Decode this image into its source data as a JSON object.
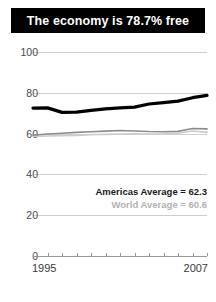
{
  "title": "The economy is 78.7% free",
  "legend": {
    "americas": "Americas Average = 62.3",
    "world": "World Average = 60.6"
  },
  "axis": {
    "x_start_label": "1995",
    "x_end_label": "2007"
  },
  "colors": {
    "title_background": "#000000",
    "title_text": "#ffffff",
    "country_line": "#000000",
    "americas_line": "#8c8c8c",
    "world_line": "#cccccc",
    "gridline": "#cfcfcf",
    "axis": "#9a9a9a"
  },
  "chart_data": {
    "type": "line",
    "title": "The economy is 78.7% free",
    "xlabel": "",
    "ylabel": "",
    "xlim": [
      1995,
      2007
    ],
    "ylim": [
      0,
      100
    ],
    "yticks": [
      0,
      20,
      40,
      60,
      80,
      100
    ],
    "ytick_labels": [
      "0",
      "20",
      "40",
      "60",
      "80",
      "100"
    ],
    "xticks": [
      1995,
      1996,
      1997,
      1998,
      1999,
      2000,
      2001,
      2002,
      2003,
      2004,
      2005,
      2006,
      2007
    ],
    "xtick_labels_shown": [
      "1995",
      "2007"
    ],
    "grid": true,
    "legend_position": "inside-right",
    "x": [
      1995,
      1996,
      1997,
      1998,
      1999,
      2000,
      2001,
      2002,
      2003,
      2004,
      2005,
      2006,
      2007
    ],
    "series": [
      {
        "name": "Country score",
        "color": "#000000",
        "values": [
          72.5,
          72.6,
          70.4,
          70.5,
          71.4,
          72.1,
          72.6,
          73.0,
          74.5,
          75.2,
          75.9,
          77.6,
          78.7
        ]
      },
      {
        "name": "Americas Average",
        "color": "#8c8c8c",
        "values": [
          59.2,
          59.8,
          60.2,
          60.6,
          60.9,
          61.2,
          61.5,
          61.3,
          61.0,
          60.9,
          61.1,
          62.5,
          62.3
        ]
      },
      {
        "name": "World Average",
        "color": "#cccccc",
        "values": [
          58.6,
          58.8,
          59.0,
          59.1,
          59.5,
          59.6,
          59.8,
          59.9,
          59.8,
          59.9,
          60.2,
          61.3,
          60.6
        ]
      }
    ],
    "annotations": [
      "Americas Average = 62.3",
      "World Average = 60.6"
    ]
  }
}
